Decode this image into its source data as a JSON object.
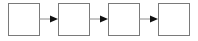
{
  "diagram": {
    "type": "linear-flow",
    "direction": "left-to-right",
    "nodes": [
      {
        "id": "node-1",
        "label": ""
      },
      {
        "id": "node-2",
        "label": ""
      },
      {
        "id": "node-3",
        "label": ""
      },
      {
        "id": "node-4",
        "label": ""
      }
    ],
    "edges": [
      {
        "from": "node-1",
        "to": "node-2"
      },
      {
        "from": "node-2",
        "to": "node-3"
      },
      {
        "from": "node-3",
        "to": "node-4"
      }
    ],
    "colors": {
      "box_border": "#7a7a7a",
      "box_fill": "#ffffff",
      "arrow_line": "#8a8a8a",
      "arrow_head": "#111111"
    }
  }
}
